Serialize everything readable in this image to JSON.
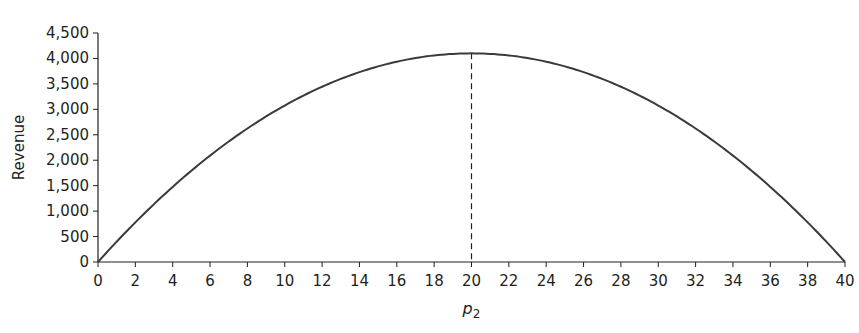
{
  "chart_data": {
    "type": "line",
    "title": "",
    "xlabel": "p2",
    "ylabel": "Revenue",
    "xlim": [
      0,
      40
    ],
    "ylim": [
      0,
      4500
    ],
    "x_ticks": [
      0,
      2,
      4,
      6,
      8,
      10,
      12,
      14,
      16,
      18,
      20,
      22,
      24,
      26,
      28,
      30,
      32,
      34,
      36,
      38,
      40
    ],
    "y_ticks": [
      0,
      500,
      1000,
      1500,
      2000,
      2500,
      3000,
      3500,
      4000,
      4500
    ],
    "y_tick_labels": [
      "0",
      "500",
      "1,000",
      "1,500",
      "2,000",
      "2,500",
      "3,000",
      "3,500",
      "4,000",
      "4,500"
    ],
    "grid": false,
    "legend": null,
    "series": [
      {
        "name": "Revenue",
        "x": [
          0,
          2,
          4,
          6,
          8,
          10,
          12,
          14,
          16,
          18,
          20,
          22,
          24,
          26,
          28,
          30,
          32,
          34,
          36,
          38,
          40
        ],
        "values": [
          0,
          779,
          1476,
          2091,
          2624,
          3075,
          3444,
          3731,
          3936,
          4059,
          4100,
          4059,
          3936,
          3731,
          3444,
          3075,
          2624,
          2091,
          1476,
          779,
          0
        ]
      }
    ],
    "annotations": [
      {
        "type": "vertical-dashed-line",
        "x": 20,
        "y_top": 4100,
        "label": "maximum revenue"
      }
    ],
    "line_color": "#3a3a3a"
  }
}
